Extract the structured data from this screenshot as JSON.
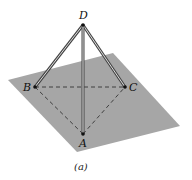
{
  "diagram": {
    "type": "tetrahedral rod structure on inclined plane",
    "points": {
      "D": {
        "label": "D",
        "x": 83,
        "y": 25
      },
      "B": {
        "label": "B",
        "x": 35,
        "y": 87
      },
      "C": {
        "label": "C",
        "x": 125,
        "y": 87
      },
      "A": {
        "label": "A",
        "x": 83,
        "y": 134
      }
    },
    "rods": [
      {
        "from": "D",
        "to": "B",
        "style": "double-line"
      },
      {
        "from": "D",
        "to": "C",
        "style": "double-line"
      },
      {
        "from": "D",
        "to": "A",
        "style": "double-line"
      }
    ],
    "dashed_edges": [
      {
        "from": "B",
        "to": "C"
      },
      {
        "from": "B",
        "to": "A"
      },
      {
        "from": "A",
        "to": "C"
      }
    ],
    "plane": {
      "color": "#a6a6a6",
      "corners": [
        [
          8,
          80
        ],
        [
          113,
          53
        ],
        [
          180,
          126
        ],
        [
          77,
          152
        ]
      ]
    },
    "caption": "(a)"
  }
}
